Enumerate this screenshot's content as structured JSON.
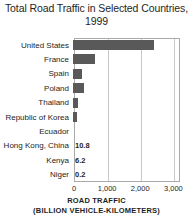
{
  "chart_data": {
    "type": "bar",
    "orientation": "horizontal",
    "title": "Total Road Traffic in Selected Countries, 1999",
    "title_line1": "Total Road Traffic in Selected Countries,",
    "title_line2": "1999",
    "categories": [
      "United States",
      "France",
      "Spain",
      "Poland",
      "Thailand",
      "Republic of Korea",
      "Ecuador",
      "Hong Kong, China",
      "Kenya",
      "Niger"
    ],
    "values": [
      2450,
      670,
      270,
      330,
      150,
      120,
      0,
      10.8,
      6.2,
      0.2
    ],
    "point_labels": [
      "",
      "",
      "",
      "",
      "",
      "",
      "",
      "10.8",
      "6.2",
      "0.2"
    ],
    "xlabel": "ROAD TRAFFIC (BILLION VEHICLE-KILOMETERS)",
    "xlabel_line1": "ROAD TRAFFIC",
    "xlabel_line2": "(BILLION VEHICLE-KILOMETERS)",
    "ylabel": "",
    "xlim": [
      0,
      3200
    ],
    "xticks": [
      0,
      1000,
      2000,
      3000
    ],
    "xtick_labels": [
      "0",
      "1,000",
      "2,000",
      "3,000"
    ],
    "grid": true,
    "grid_axis": "x",
    "legend": false,
    "bar_color": "#595959",
    "frame_color": "#aaaaaa",
    "grid_color": "#c9c9c9",
    "background": "#ffffff"
  }
}
